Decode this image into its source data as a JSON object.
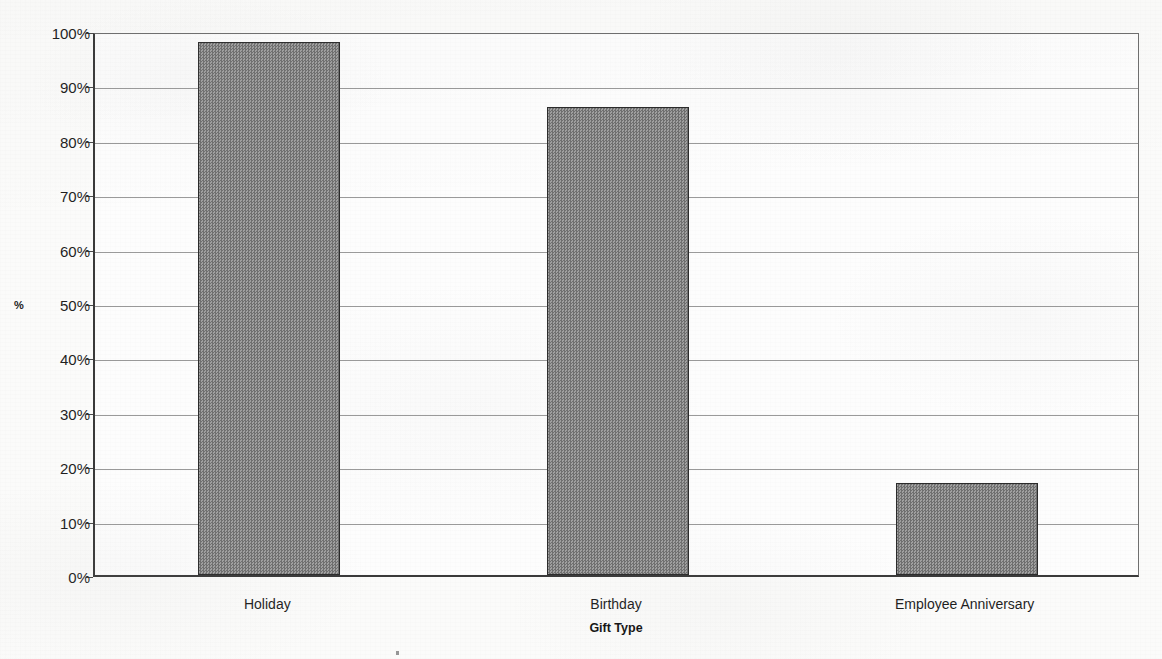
{
  "chart_data": {
    "type": "bar",
    "title": "",
    "xlabel": "Gift Type",
    "ylabel": "%",
    "categories": [
      "Holiday",
      "Birthday",
      "Employee Anniversary"
    ],
    "values": [
      98,
      86,
      17
    ],
    "value_labels": [
      "98%",
      "86%",
      "17%"
    ],
    "ylim": [
      0,
      100
    ],
    "ytick_labels": [
      "100%",
      "90%",
      "80%",
      "70%",
      "60%",
      "50%",
      "40%",
      "30%",
      "20%",
      "10%",
      "0%"
    ],
    "ytick_values": [
      100,
      90,
      80,
      70,
      60,
      50,
      40,
      30,
      20,
      10,
      0
    ],
    "grid": true,
    "legend": "none",
    "series": [
      {
        "name": "%",
        "values": [
          98,
          86,
          17
        ],
        "fill_color": "#848484",
        "border_color": "#2b2b2b",
        "fill_pattern": "checkerboard-dither"
      }
    ]
  },
  "chart": {
    "title": "",
    "y_axis_title": "%",
    "x_axis_title": "Gift Type",
    "plot_background": "#ffffff",
    "gridline_color": "#9a9a9a",
    "axis_color": "#3a3a3a"
  }
}
